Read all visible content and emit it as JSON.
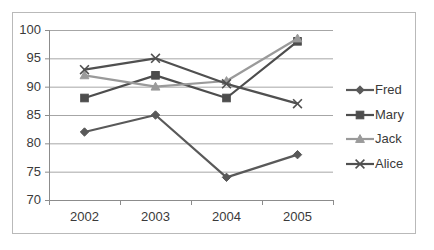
{
  "chart_data": {
    "type": "line",
    "title": "",
    "xlabel": "",
    "ylabel": "",
    "categories": [
      "2002",
      "2003",
      "2004",
      "2005"
    ],
    "ylim": [
      70,
      100
    ],
    "yticks": [
      70,
      75,
      80,
      85,
      90,
      95,
      100
    ],
    "ytick_labels": [
      "70",
      "75",
      "80",
      "85",
      "90",
      "95",
      "100"
    ],
    "grid": "horizontal",
    "legend_position": "right",
    "series": [
      {
        "name": "Fred",
        "marker": "diamond",
        "color": "#595959",
        "values": [
          82,
          85,
          74,
          78
        ]
      },
      {
        "name": "Mary",
        "marker": "square",
        "color": "#4d4d4d",
        "values": [
          88,
          92,
          88,
          98
        ]
      },
      {
        "name": "Jack",
        "marker": "triangle",
        "color": "#9a9a9a",
        "values": [
          92,
          90,
          91,
          98.5
        ]
      },
      {
        "name": "Alice",
        "marker": "cross",
        "color": "#505050",
        "values": [
          93,
          95,
          90.5,
          87
        ]
      }
    ]
  },
  "axis": {
    "y_labels": [
      "100",
      "95",
      "90",
      "85",
      "80",
      "75",
      "70"
    ],
    "x_labels": [
      "2002",
      "2003",
      "2004",
      "2005"
    ]
  },
  "legend": {
    "items": [
      {
        "label": "Fred",
        "marker": "diamond-marker-icon"
      },
      {
        "label": "Mary",
        "marker": "square-marker-icon"
      },
      {
        "label": "Jack",
        "marker": "triangle-marker-icon"
      },
      {
        "label": "Alice",
        "marker": "cross-marker-icon"
      }
    ]
  },
  "colors": {
    "frame_border": "#b9b9b9",
    "gridline": "#a6a6a6",
    "axis": "#8c8c8c",
    "tick_text": "#3a3a3a",
    "fred": "#595959",
    "mary": "#4d4d4d",
    "jack": "#9a9a9a",
    "alice": "#505050"
  }
}
